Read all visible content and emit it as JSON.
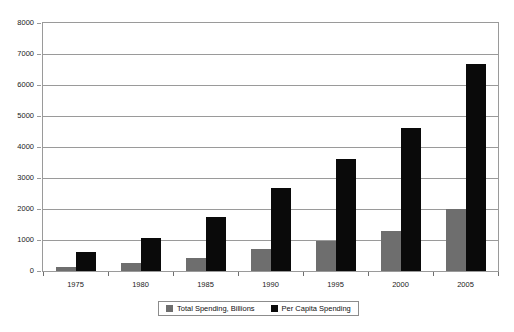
{
  "chart_data": {
    "type": "bar",
    "title": "",
    "subtitle": "",
    "xlabel": "",
    "ylabel": "",
    "categories": [
      "1975",
      "1980",
      "1985",
      "1990",
      "1995",
      "2000",
      "2005"
    ],
    "series": [
      {
        "name": "Total Spending, Billions",
        "color": "#6e6e6e",
        "values": [
          130,
          250,
          430,
          700,
          980,
          1300,
          2000
        ]
      },
      {
        "name": "Per Capita Spending",
        "color": "#0a0a0a",
        "values": [
          600,
          1060,
          1730,
          2690,
          3620,
          4620,
          6680
        ]
      }
    ],
    "ylim": [
      0,
      8000
    ],
    "yticks": [
      0,
      1000,
      2000,
      3000,
      4000,
      5000,
      6000,
      7000,
      8000
    ],
    "ytick_labels": [
      "0",
      "1000",
      "2000",
      "3000",
      "4000",
      "5000",
      "6000",
      "7000",
      "8000"
    ],
    "grid": true,
    "grid_axis": "y",
    "legend_position": "bottom",
    "plot_background": "#ffffff",
    "grid_color": "#9a9a9a",
    "frame_color": "#9a9a9a"
  },
  "legend": {
    "entries": [
      {
        "label": "Total Spending, Billions",
        "swatch": "#6e6e6e"
      },
      {
        "label": "Per Capita Spending",
        "swatch": "#0a0a0a"
      }
    ]
  }
}
